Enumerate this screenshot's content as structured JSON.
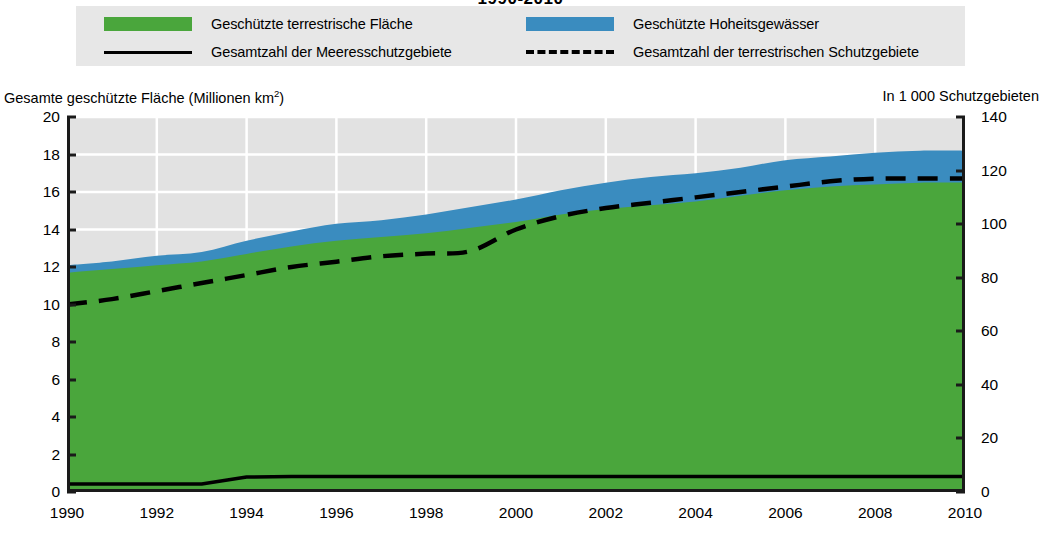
{
  "title": "1990-2010",
  "legend": {
    "items": [
      {
        "key": "terrestrial-area",
        "label": "Geschützte terrestrische Fläche",
        "marker": "swatch",
        "color": "#4aa63c"
      },
      {
        "key": "marine-waters-area",
        "label": "Geschützte Hoheitsgewässer",
        "marker": "swatch",
        "color": "#3a8cbf"
      },
      {
        "key": "marine-count",
        "label": "Gesamtzahl der Meeresschutzgebiete",
        "marker": "solid-line",
        "color": "#000000"
      },
      {
        "key": "terrestrial-count",
        "label": "Gesamtzahl der terrestrischen Schutzgebiete",
        "marker": "dash-line",
        "color": "#000000"
      }
    ]
  },
  "axis_captions": {
    "left": "Gesamte geschützte Fläche (Millionen km",
    "left_sup": "2",
    "left_tail": ")",
    "right": "In 1 000 Schutzgebieten"
  },
  "chart_data": {
    "type": "area",
    "title": "1990-2010",
    "xlabel": "",
    "ylabel": "Gesamte geschützte Fläche (Millionen km²)",
    "y2label": "In 1 000 Schutzgebieten",
    "grid": true,
    "legend_position": "top",
    "xlim": [
      1990,
      2010
    ],
    "ylim": [
      0,
      20
    ],
    "y2lim": [
      0,
      140
    ],
    "xticks": [
      1990,
      1992,
      1994,
      1996,
      1998,
      2000,
      2002,
      2004,
      2006,
      2008,
      2010
    ],
    "yticks": [
      0,
      2,
      4,
      6,
      8,
      10,
      12,
      14,
      16,
      18,
      20
    ],
    "y2ticks": [
      0,
      20,
      40,
      60,
      80,
      100,
      120,
      140
    ],
    "x": [
      1990,
      1991,
      1992,
      1993,
      1994,
      1995,
      1996,
      1997,
      1998,
      1999,
      2000,
      2001,
      2002,
      2003,
      2004,
      2005,
      2006,
      2007,
      2008,
      2009,
      2010
    ],
    "series": [
      {
        "name": "Geschützte terrestrische Fläche",
        "key": "terrestrial-area",
        "axis": "left",
        "type": "area-stacked",
        "color": "#4aa63c",
        "unit": "Millionen km²",
        "values": [
          11.7,
          11.9,
          12.1,
          12.3,
          12.7,
          13.1,
          13.4,
          13.6,
          13.8,
          14.1,
          14.4,
          14.8,
          15.1,
          15.3,
          15.5,
          15.8,
          16.1,
          16.3,
          16.4,
          16.5,
          16.5
        ]
      },
      {
        "name": "Geschützte Hoheitsgewässer",
        "key": "marine-waters-area",
        "axis": "left",
        "type": "area-stacked",
        "color": "#3a8cbf",
        "unit": "Millionen km²",
        "values": [
          0.4,
          0.4,
          0.5,
          0.5,
          0.7,
          0.8,
          0.9,
          0.9,
          1.0,
          1.1,
          1.2,
          1.3,
          1.4,
          1.5,
          1.5,
          1.5,
          1.6,
          1.6,
          1.7,
          1.7,
          1.7
        ]
      },
      {
        "name": "Gesamte geschützte Fläche (Summe)",
        "key": "total-area",
        "axis": "left",
        "type": "stack-top",
        "unit": "Millionen km²",
        "values": [
          12.1,
          12.3,
          12.6,
          12.8,
          13.4,
          13.9,
          14.3,
          14.5,
          14.8,
          15.2,
          15.6,
          16.1,
          16.5,
          16.8,
          17.0,
          17.3,
          17.7,
          17.9,
          18.1,
          18.2,
          18.2
        ]
      },
      {
        "name": "Gesamtzahl der Meeresschutzgebiete",
        "key": "marine-count",
        "axis": "right",
        "type": "line",
        "color": "#000000",
        "style": "solid",
        "unit": "1 000 Schutzgebiete",
        "values": [
          3.0,
          3.0,
          3.0,
          3.0,
          5.6,
          5.8,
          5.8,
          5.8,
          5.8,
          5.8,
          5.8,
          5.8,
          5.8,
          5.8,
          5.8,
          5.8,
          5.8,
          5.8,
          5.8,
          5.8,
          5.8
        ]
      },
      {
        "name": "Gesamtzahl der terrestrischen Schutzgebiete",
        "key": "terrestrial-count",
        "axis": "right",
        "type": "line",
        "color": "#000000",
        "style": "dashed",
        "unit": "1 000 Schutzgebiete",
        "values": [
          70,
          72,
          75,
          78,
          81,
          84,
          86,
          88,
          89,
          90,
          98,
          103,
          106,
          108,
          110,
          112,
          114,
          116,
          117,
          117,
          117
        ]
      }
    ]
  }
}
